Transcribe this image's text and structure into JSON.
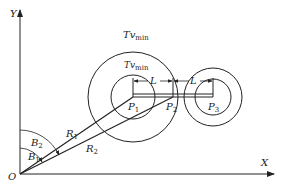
{
  "diagram": {
    "axes": {
      "x_label": "X",
      "y_label": "Y",
      "origin_label": "O"
    },
    "points": [
      {
        "name": "P",
        "sub": "1"
      },
      {
        "name": "P",
        "sub": "2"
      },
      {
        "name": "P",
        "sub": "3"
      }
    ],
    "circle_labels": {
      "outer": {
        "main": "Tv",
        "sub": "min"
      },
      "inner": {
        "main": "Tv",
        "sub": "min"
      }
    },
    "distance_labels": [
      "L",
      "L"
    ],
    "rays": [
      {
        "name": "R",
        "sub": "1"
      },
      {
        "name": "R",
        "sub": "2"
      }
    ],
    "angles": [
      {
        "name": "B",
        "sub": "2"
      },
      {
        "name": "B",
        "sub": "1"
      }
    ],
    "colors": {
      "stroke": "#222222",
      "background": "#ffffff"
    }
  }
}
